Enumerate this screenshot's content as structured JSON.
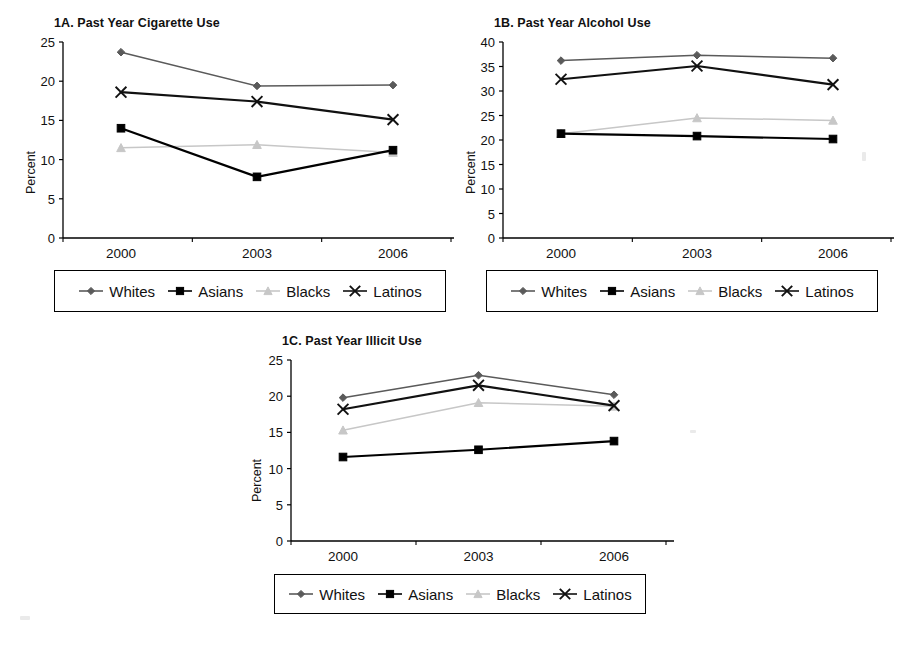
{
  "figure": {
    "background": "#ffffff",
    "axis_color": "#000000"
  },
  "series_style": {
    "whites": {
      "label": "Whites",
      "color": "#5a5a5a",
      "marker": "diamond"
    },
    "asians": {
      "label": "Asians",
      "color": "#000000",
      "marker": "square"
    },
    "blacks": {
      "label": "Blacks",
      "color": "#c7c7c7",
      "marker": "triangle"
    },
    "latinos": {
      "label": "Latinos",
      "color": "#111111",
      "marker": "cross"
    }
  },
  "legend": {
    "entries": [
      {
        "key": "whites",
        "label": "Whites"
      },
      {
        "key": "asians",
        "label": "Asians"
      },
      {
        "key": "blacks",
        "label": "Blacks"
      },
      {
        "key": "latinos",
        "label": "Latinos"
      }
    ]
  },
  "chart_data": [
    {
      "id": "1A",
      "type": "line",
      "title": "1A. Past Year Cigarette Use",
      "xlabel": "",
      "ylabel": "Percent",
      "categories": [
        "2000",
        "2003",
        "2006"
      ],
      "ylim": [
        0,
        25
      ],
      "yticks": [
        0,
        5,
        10,
        15,
        20,
        25
      ],
      "grid": false,
      "legend_position": "bottom",
      "series": [
        {
          "name": "Whites",
          "values": [
            23.7,
            19.4,
            19.5
          ]
        },
        {
          "name": "Asians",
          "values": [
            14.0,
            7.8,
            11.2
          ]
        },
        {
          "name": "Blacks",
          "values": [
            11.5,
            11.9,
            10.9
          ]
        },
        {
          "name": "Latinos",
          "values": [
            18.6,
            17.4,
            15.1
          ]
        }
      ]
    },
    {
      "id": "1B",
      "type": "line",
      "title": "1B. Past Year Alcohol Use",
      "xlabel": "",
      "ylabel": "Percent",
      "categories": [
        "2000",
        "2003",
        "2006"
      ],
      "ylim": [
        0,
        40
      ],
      "yticks": [
        0,
        5,
        10,
        15,
        20,
        25,
        30,
        35,
        40
      ],
      "grid": false,
      "legend_position": "bottom",
      "series": [
        {
          "name": "Whites",
          "values": [
            36.2,
            37.3,
            36.7
          ]
        },
        {
          "name": "Asians",
          "values": [
            21.3,
            20.8,
            20.2
          ]
        },
        {
          "name": "Blacks",
          "values": [
            21.3,
            24.5,
            24.0
          ]
        },
        {
          "name": "Latinos",
          "values": [
            32.4,
            35.1,
            31.3
          ]
        }
      ]
    },
    {
      "id": "1C",
      "type": "line",
      "title": "1C. Past Year Illicit Use",
      "xlabel": "",
      "ylabel": "Percent",
      "categories": [
        "2000",
        "2003",
        "2006"
      ],
      "ylim": [
        0,
        25
      ],
      "yticks": [
        0,
        5,
        10,
        15,
        20,
        25
      ],
      "grid": false,
      "legend_position": "bottom",
      "series": [
        {
          "name": "Whites",
          "values": [
            19.8,
            22.9,
            20.2
          ]
        },
        {
          "name": "Asians",
          "values": [
            11.6,
            12.6,
            13.8
          ]
        },
        {
          "name": "Blacks",
          "values": [
            15.3,
            19.1,
            18.6
          ]
        },
        {
          "name": "Latinos",
          "values": [
            18.2,
            21.5,
            18.7
          ]
        }
      ]
    }
  ]
}
